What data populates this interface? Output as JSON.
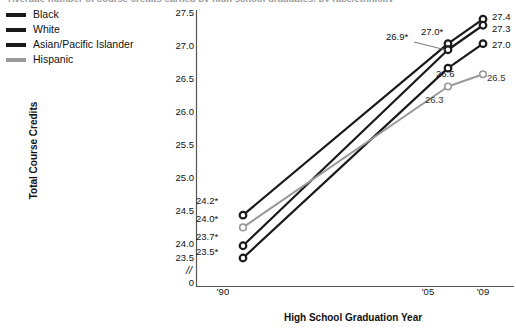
{
  "figure": {
    "title_cutoff": "Average number of course credits earned by high school graduates, by race/ethnicity"
  },
  "legend": {
    "position": "top-left",
    "items": [
      {
        "label": "Black",
        "color": "#1a1a1a"
      },
      {
        "label": "White",
        "color": "#1a1a1a"
      },
      {
        "label": "Asian/Pacific Islander",
        "color": "#1a1a1a"
      },
      {
        "label": "Hispanic",
        "color": "#999999"
      }
    ]
  },
  "axes": {
    "ylabel": "Total Course Credits",
    "xlabel": "High School Graduation Year",
    "yticks": [
      "27.5",
      "27.0",
      "26.5",
      "26.0",
      "25.5",
      "25.0",
      "24.5",
      "24.0",
      "23.5"
    ],
    "axis_break": "//",
    "yzero": "0",
    "xticks": [
      "'90",
      "'05",
      "'09"
    ]
  },
  "data_labels": {
    "left": [
      "24.2*",
      "24.0*",
      "23.7*",
      "23.5*"
    ],
    "mid": [
      "26.9*",
      "27.0*",
      "26.6",
      "26.3"
    ],
    "right": [
      "27.4",
      "27.3",
      "27.0",
      "26.5"
    ]
  },
  "chart_data": {
    "type": "line",
    "title": "Average number of course credits earned by high school graduates, by race/ethnicity",
    "xlabel": "High School Graduation Year",
    "ylabel": "Total Course Credits",
    "x": [
      "'90",
      "'05",
      "'09"
    ],
    "ylim": [
      23.3,
      27.6
    ],
    "yticks": [
      23.5,
      24.0,
      24.5,
      25.0,
      25.5,
      26.0,
      26.5,
      27.0,
      27.5
    ],
    "grid": false,
    "legend_position": "top-left outside",
    "axis_break_below": 23.5,
    "series": [
      {
        "name": "Black",
        "color": "#1a1a1a",
        "values": [
          23.5,
          26.6,
          27.0
        ],
        "labels": [
          "23.5*",
          "26.6",
          "27.0"
        ]
      },
      {
        "name": "White",
        "color": "#1a1a1a",
        "values": [
          24.2,
          27.0,
          27.4
        ],
        "labels": [
          "24.2*",
          "27.0*",
          "27.4"
        ]
      },
      {
        "name": "Asian/Pacific Islander",
        "color": "#1a1a1a",
        "values": [
          23.7,
          26.9,
          27.3
        ],
        "labels": [
          "23.7*",
          "26.9*",
          "27.3"
        ]
      },
      {
        "name": "Hispanic",
        "color": "#999999",
        "values": [
          24.0,
          26.3,
          26.5
        ],
        "labels": [
          "24.0*",
          "26.3",
          "26.5"
        ]
      }
    ],
    "annotations": [
      "* indicates statistically significant difference from 2009"
    ]
  }
}
